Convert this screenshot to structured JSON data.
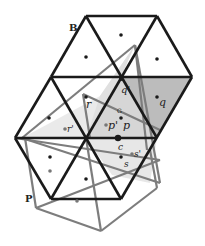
{
  "figure": {
    "width": 205,
    "height": 246,
    "colors": {
      "black_edge": "#1a1a1a",
      "gray_edge": "#7a7a7a",
      "light_fill": "#e6e6e6",
      "mid_fill": "#d4d4d4",
      "dark_fill": "#b9b9b9",
      "point": "#1a1a1a",
      "gray_point": "#777777"
    },
    "labels": {
      "B": "B",
      "P": "P",
      "G": "G",
      "c": "c",
      "q": "q",
      "q_prime": "q'",
      "r": "r",
      "r_prime": "r'",
      "p": "p",
      "p_prime": "p'",
      "s": "s",
      "s_prime": "s'"
    }
  }
}
